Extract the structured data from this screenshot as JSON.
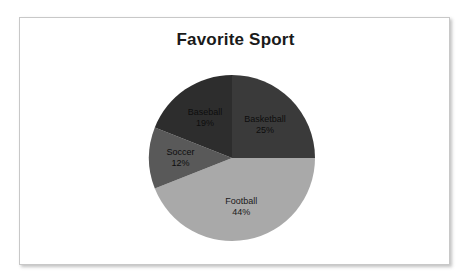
{
  "chart_data": {
    "type": "pie",
    "title": "Favorite Sport",
    "categories": [
      "Basketball",
      "Football",
      "Soccer",
      "Baseball"
    ],
    "values": [
      25,
      44,
      12,
      19
    ],
    "value_unit": "%",
    "labels": [
      "Basketball\n25%",
      "Football\n44%",
      "Soccer\n12%",
      "Baseball\n19%"
    ],
    "legend": "none",
    "grid": false,
    "start_angle_deg": 0,
    "direction": "clockwise",
    "slices": [
      {
        "name": "Basketball",
        "value": 25,
        "value_text": "25%",
        "color": "#3a3a3a",
        "start_deg": 0,
        "end_deg": 90
      },
      {
        "name": "Football",
        "value": 44,
        "value_text": "44%",
        "color": "#a9a9a9",
        "start_deg": 90,
        "end_deg": 248.4
      },
      {
        "name": "Soccer",
        "value": 12,
        "value_text": "12%",
        "color": "#595959",
        "start_deg": 248.4,
        "end_deg": 291.6
      },
      {
        "name": "Baseball",
        "value": 19,
        "value_text": "19%",
        "color": "#2d2d2d",
        "start_deg": 291.6,
        "end_deg": 360
      }
    ]
  },
  "chart": {
    "title": "Favorite Sport",
    "border_color": "#c8c8c8",
    "background": "#ffffff"
  }
}
